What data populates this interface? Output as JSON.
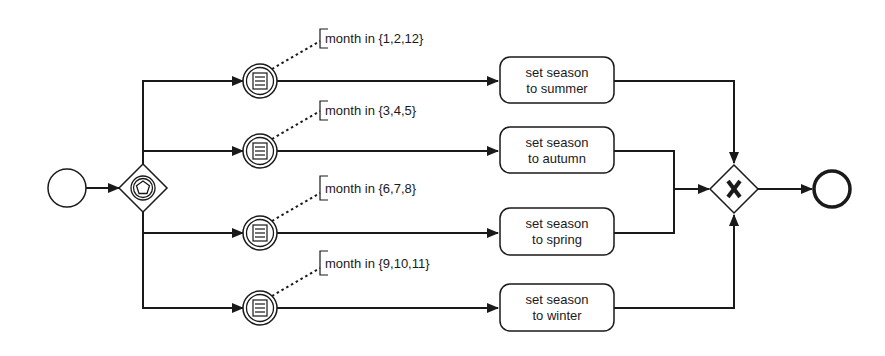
{
  "diagram": {
    "type": "BPMN process",
    "colors": {
      "stroke": "#1a1a1a",
      "background": "#ffffff"
    },
    "start_event": {
      "icon": "start-event-circle"
    },
    "split_gateway": {
      "type": "event-based gateway",
      "icon": "pentagon-in-circle"
    },
    "branches": [
      {
        "condition": "month in {1,2,12}",
        "task_line1": "set season",
        "task_line2": "to summer",
        "event_icon": "conditional-event"
      },
      {
        "condition": "month in {3,4,5}",
        "task_line1": "set season",
        "task_line2": "to autumn",
        "event_icon": "conditional-event"
      },
      {
        "condition": "month in {6,7,8}",
        "task_line1": "set season",
        "task_line2": "to spring",
        "event_icon": "conditional-event"
      },
      {
        "condition": "month in {9,10,11}",
        "task_line1": "set season",
        "task_line2": "to winter",
        "event_icon": "conditional-event"
      }
    ],
    "merge_gateway": {
      "type": "exclusive gateway",
      "marker": "X"
    },
    "end_event": {
      "icon": "end-event-circle"
    }
  }
}
